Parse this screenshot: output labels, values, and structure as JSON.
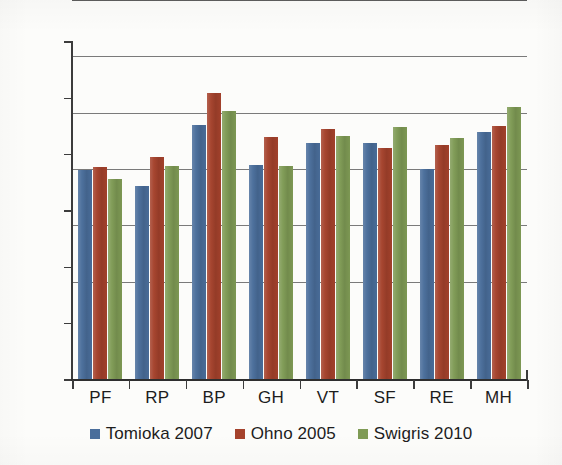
{
  "chart_data": {
    "type": "bar",
    "title": "",
    "subtitle": "",
    "xlabel": "",
    "ylabel": "",
    "categories": [
      "PF",
      "RP",
      "BP",
      "GH",
      "VT",
      "SF",
      "RE",
      "MH"
    ],
    "series": [
      {
        "name": "Tomioka 2007",
        "color": "#4a6e9b",
        "values": [
          37.3,
          34.5,
          45.2,
          38.2,
          42.0,
          42.0,
          37.5,
          44.0
        ]
      },
      {
        "name": "Ohno 2005",
        "color": "#a5422c",
        "values": [
          37.8,
          39.6,
          50.9,
          43.1,
          44.6,
          41.2,
          41.7,
          45.1
        ]
      },
      {
        "name": "Swigris 2010",
        "color": "#7f9b55",
        "values": [
          35.6,
          38.0,
          47.7,
          38.0,
          43.3,
          44.9,
          43.0,
          48.5
        ]
      }
    ],
    "ylim": [
      0,
      60
    ],
    "ytick_interval": 10,
    "yticks": [
      60,
      50,
      40,
      30,
      20,
      10,
      0
    ],
    "ytick_labels": [
      "60",
      "50",
      "40",
      "30",
      "20",
      "10",
      "0"
    ],
    "grid": true,
    "grid_axis": "y",
    "legend_position": "bottom",
    "bar_orientation": "vertical",
    "grouping": "grouped"
  },
  "legend": {
    "items": [
      {
        "label": "Tomioka 2007",
        "color": "#4a6e9b"
      },
      {
        "label": "Ohno 2005",
        "color": "#a5422c"
      },
      {
        "label": "Swigris 2010",
        "color": "#7f9b55"
      }
    ]
  }
}
